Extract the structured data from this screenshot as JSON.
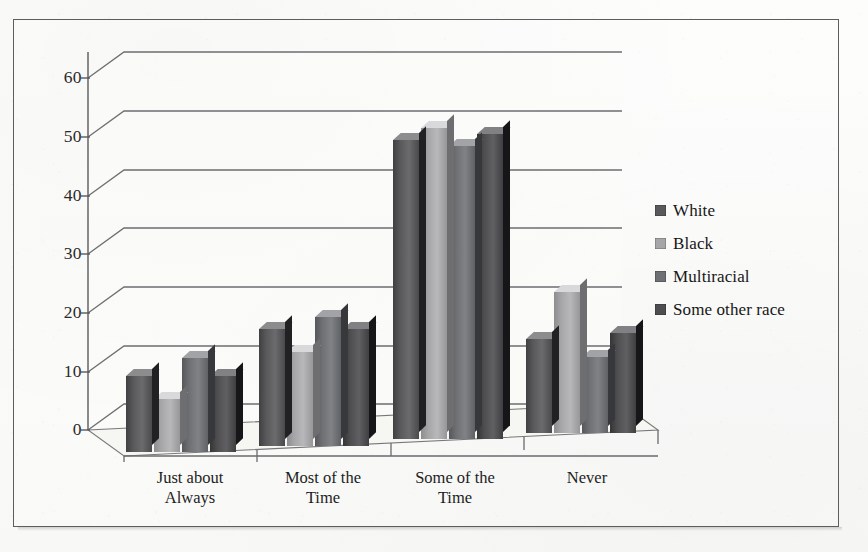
{
  "chart_data": {
    "type": "bar",
    "title": "",
    "subtitle": "",
    "xlabel": "",
    "ylabel": "",
    "ylim": [
      0,
      60
    ],
    "yticks": [
      0,
      10,
      20,
      30,
      40,
      50,
      60
    ],
    "grid": true,
    "legend_position": "right",
    "style": "3d-clustered-column",
    "categories": [
      "Just about Always",
      "Most of the Time",
      "Some of the Time",
      "Never"
    ],
    "category_lines": [
      [
        "Just about",
        "Always"
      ],
      [
        "Most of the",
        "Time"
      ],
      [
        "Some of the",
        "Time"
      ],
      [
        "Never",
        ""
      ]
    ],
    "series": [
      {
        "name": "White",
        "color": "#59595b",
        "values": [
          13,
          20,
          51,
          16
        ]
      },
      {
        "name": "Black",
        "color": "#a6a6a8",
        "values": [
          9,
          16,
          53,
          24
        ]
      },
      {
        "name": "Multiracial",
        "color": "#6f7073",
        "values": [
          16,
          22,
          50,
          13
        ]
      },
      {
        "name": "Some other race",
        "color": "#4e4e50",
        "values": [
          13,
          20,
          52,
          17
        ]
      }
    ]
  },
  "legend": {
    "items": [
      {
        "label": "White"
      },
      {
        "label": "Black"
      },
      {
        "label": "Multiracial"
      },
      {
        "label": "Some other race"
      }
    ]
  },
  "axis": {
    "y_tick_labels": [
      "60",
      "50",
      "40",
      "30",
      "20",
      "10",
      "0"
    ]
  },
  "colors": {
    "frame": "#5d5d5d",
    "gridline": "#6e6e70",
    "axis": "#5a5a5c",
    "wall": "#fbfbf9",
    "floor": "#f4f4f2",
    "text": "#1a1a1a"
  }
}
